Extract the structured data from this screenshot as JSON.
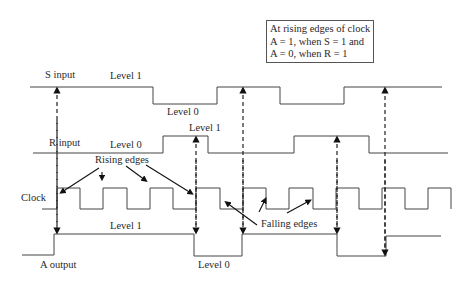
{
  "note": {
    "lines": [
      "At rising edges of clock",
      "A = 1, when S = 1 and",
      "A = 0, when R = 1"
    ]
  },
  "signals": {
    "s_input": {
      "label": "S input",
      "level_high_label": "Level 1",
      "level_low_label": "Level 0"
    },
    "r_input": {
      "label": "R input",
      "level_low_label": "Level 0",
      "level_high_label": "Level 1"
    },
    "clock": {
      "label": "Clock",
      "rising_label": "Rising edges",
      "falling_label": "Falling edges"
    },
    "a_output": {
      "label": "A output",
      "level_high_label": "Level 1",
      "level_low_label": "Level 0"
    }
  },
  "colors": {
    "line": "#444444",
    "arrow": "#111111"
  }
}
